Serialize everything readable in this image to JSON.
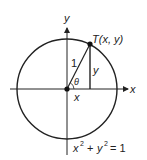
{
  "diagram": {
    "axes": {
      "x_label": "x",
      "y_label": "y"
    },
    "point": {
      "label": "T(x, y)"
    },
    "labels": {
      "radius": "1",
      "angle": "θ",
      "vertical_leg": "y",
      "horizontal_leg": "x"
    },
    "equation": {
      "x_term": "x",
      "x_exp": "2",
      "plus": "+",
      "y_term": "y",
      "y_exp": "2",
      "equals": "= 1"
    },
    "colors": {
      "stroke": "#222222",
      "background": "#ffffff"
    }
  }
}
